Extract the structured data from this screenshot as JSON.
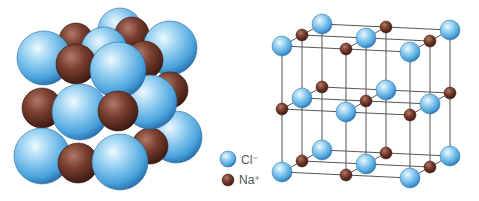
{
  "colors": {
    "cl_light": "#cfe9fb",
    "cl_mid": "#6fbde9",
    "cl_dark": "#2a7fc0",
    "na_light": "#a8705f",
    "na_mid": "#7a3f30",
    "na_dark": "#4a2018",
    "lattice_line": "#555555",
    "background": "#ffffff"
  },
  "legend": {
    "items": [
      {
        "ion": "chloride",
        "label": "Cl⁻",
        "color": "#6fbde9"
      },
      {
        "ion": "sodium",
        "label": "Na⁺",
        "color": "#7a3f30"
      }
    ]
  },
  "space_filling_model": {
    "description": "Space-filling model of NaCl crystal",
    "spheres": [
      {
        "ion": "Cl",
        "cx": 120,
        "cy": 30,
        "r": 22
      },
      {
        "ion": "Na",
        "cx": 76,
        "cy": 40,
        "r": 17
      },
      {
        "ion": "Na",
        "cx": 132,
        "cy": 34,
        "r": 17
      },
      {
        "ion": "Cl",
        "cx": 104,
        "cy": 50,
        "r": 23
      },
      {
        "ion": "Cl",
        "cx": 170,
        "cy": 48,
        "r": 27
      },
      {
        "ion": "Na",
        "cx": 170,
        "cy": 90,
        "r": 18
      },
      {
        "ion": "Cl",
        "cx": 44,
        "cy": 58,
        "r": 27
      },
      {
        "ion": "Na",
        "cx": 76,
        "cy": 64,
        "r": 20
      },
      {
        "ion": "Na",
        "cx": 144,
        "cy": 60,
        "r": 19
      },
      {
        "ion": "Cl",
        "cx": 176,
        "cy": 137,
        "r": 26
      },
      {
        "ion": "Na",
        "cx": 42,
        "cy": 108,
        "r": 20
      },
      {
        "ion": "Na",
        "cx": 150,
        "cy": 146,
        "r": 18
      },
      {
        "ion": "Cl",
        "cx": 150,
        "cy": 102,
        "r": 27
      },
      {
        "ion": "Cl",
        "cx": 118,
        "cy": 70,
        "r": 28
      },
      {
        "ion": "Cl",
        "cx": 80,
        "cy": 112,
        "r": 28
      },
      {
        "ion": "Na",
        "cx": 118,
        "cy": 111,
        "r": 20
      },
      {
        "ion": "Cl",
        "cx": 42,
        "cy": 156,
        "r": 28
      },
      {
        "ion": "Na",
        "cx": 78,
        "cy": 163,
        "r": 20
      },
      {
        "ion": "Cl",
        "cx": 120,
        "cy": 162,
        "r": 28
      }
    ]
  },
  "ball_and_stick_model": {
    "description": "Ball-and-stick lattice of NaCl",
    "grid": {
      "origin": [
        282,
        46
      ],
      "step_x": [
        64,
        3
      ],
      "step_y": [
        0,
        63
      ],
      "step_z_back": [
        20,
        -11
      ]
    },
    "atoms": [
      {
        "ion": "Cl",
        "x": 322,
        "y": 24
      },
      {
        "ion": "Na",
        "x": 386,
        "y": 27
      },
      {
        "ion": "Cl",
        "x": 450,
        "y": 30
      },
      {
        "ion": "Na",
        "x": 302,
        "y": 35
      },
      {
        "ion": "Cl",
        "x": 366,
        "y": 38
      },
      {
        "ion": "Na",
        "x": 430,
        "y": 41
      },
      {
        "ion": "Cl",
        "x": 282,
        "y": 46
      },
      {
        "ion": "Na",
        "x": 346,
        "y": 49
      },
      {
        "ion": "Cl",
        "x": 410,
        "y": 52
      },
      {
        "ion": "Na",
        "x": 322,
        "y": 87
      },
      {
        "ion": "Cl",
        "x": 386,
        "y": 90
      },
      {
        "ion": "Na",
        "x": 450,
        "y": 93
      },
      {
        "ion": "Cl",
        "x": 302,
        "y": 98
      },
      {
        "ion": "Na",
        "x": 366,
        "y": 101
      },
      {
        "ion": "Cl",
        "x": 430,
        "y": 104
      },
      {
        "ion": "Na",
        "x": 282,
        "y": 109
      },
      {
        "ion": "Cl",
        "x": 346,
        "y": 112
      },
      {
        "ion": "Na",
        "x": 410,
        "y": 115
      },
      {
        "ion": "Cl",
        "x": 322,
        "y": 150
      },
      {
        "ion": "Na",
        "x": 386,
        "y": 153
      },
      {
        "ion": "Cl",
        "x": 450,
        "y": 156
      },
      {
        "ion": "Na",
        "x": 302,
        "y": 161
      },
      {
        "ion": "Cl",
        "x": 366,
        "y": 164
      },
      {
        "ion": "Na",
        "x": 430,
        "y": 167
      },
      {
        "ion": "Cl",
        "x": 282,
        "y": 172
      },
      {
        "ion": "Na",
        "x": 346,
        "y": 175
      },
      {
        "ion": "Cl",
        "x": 410,
        "y": 178
      }
    ],
    "cl_radius": 10,
    "na_radius": 6
  }
}
